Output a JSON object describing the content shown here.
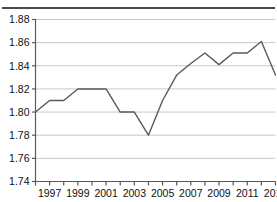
{
  "header": {
    "truncated_title": "",
    "rule_color": "#4a4a4a"
  },
  "chart_data": {
    "type": "line",
    "title": "",
    "subtitle": "",
    "xlabel": "",
    "ylabel": "",
    "x": [
      1996,
      1997,
      1998,
      1999,
      2000,
      2001,
      2002,
      2003,
      2004,
      2005,
      2006,
      2007,
      2008,
      2009,
      2010,
      2011,
      2012,
      2013
    ],
    "values": [
      1.8,
      1.81,
      1.81,
      1.82,
      1.82,
      1.82,
      1.8,
      1.8,
      1.78,
      1.81,
      1.832,
      1.842,
      1.851,
      1.841,
      1.851,
      1.851,
      1.861,
      1.832
    ],
    "series": [
      {
        "name": "series-1",
        "values": [
          1.8,
          1.81,
          1.81,
          1.82,
          1.82,
          1.82,
          1.8,
          1.8,
          1.78,
          1.81,
          1.832,
          1.842,
          1.851,
          1.841,
          1.851,
          1.851,
          1.861,
          1.832
        ],
        "color": "#595959"
      }
    ],
    "ylim": [
      1.74,
      1.88
    ],
    "xlim": [
      1996,
      2013
    ],
    "yticks": [
      1.74,
      1.76,
      1.78,
      1.8,
      1.82,
      1.84,
      1.86,
      1.88
    ],
    "ytick_labels": [
      "1.74",
      "1.76",
      "1.78",
      "1.80",
      "1.82",
      "1.84",
      "1.86",
      "1.88"
    ],
    "xticks": [
      1996,
      1997,
      1998,
      1999,
      2000,
      2001,
      2002,
      2003,
      2004,
      2005,
      2006,
      2007,
      2008,
      2009,
      2010,
      2011,
      2012,
      2013
    ],
    "xtick_labels": [
      "",
      "1997",
      "",
      "1999",
      "",
      "2001",
      "",
      "2003",
      "",
      "2005",
      "",
      "2007",
      "",
      "2009",
      "",
      "2011",
      "",
      "2013"
    ],
    "grid": true,
    "grid_axis": "y",
    "grid_color": "#c8c8c8",
    "legend": false,
    "legend_position": "none",
    "line_color": "#595959",
    "line_width": 1.4,
    "markers": false,
    "axis_color": "#595959",
    "background": "#ffffff"
  }
}
